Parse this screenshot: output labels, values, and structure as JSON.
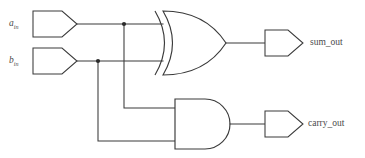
{
  "diagram": {
    "background_color": "#ffffff",
    "line_color": "#3a3a3a",
    "junction_color": "#2b2b2b",
    "width": 365,
    "height": 158
  },
  "inputs": [
    {
      "id": "a-in",
      "label_base": "a",
      "label_sub": "in",
      "port_shape": "pentagon-right",
      "wire_y": 24
    },
    {
      "id": "b-in",
      "label_base": "b",
      "label_sub": "in",
      "port_shape": "pentagon-right",
      "wire_y": 61
    }
  ],
  "gates": [
    {
      "id": "xor-gate",
      "type": "XOR",
      "name": "xor-gate",
      "output_signal": "sum_out"
    },
    {
      "id": "and-gate",
      "type": "AND",
      "name": "and-gate",
      "output_signal": "carry_out"
    }
  ],
  "outputs": [
    {
      "id": "sum-out",
      "label": "sum_out",
      "port_shape": "pentagon-right",
      "wire_y": 43
    },
    {
      "id": "carry-out",
      "label": "carry_out",
      "port_shape": "pentagon-right",
      "wire_y": 124
    }
  ],
  "junctions": [
    {
      "id": "junction-a",
      "x": 124,
      "y": 24,
      "on_net": "a_in"
    },
    {
      "id": "junction-b",
      "x": 98,
      "y": 61,
      "on_net": "b_in"
    }
  ]
}
